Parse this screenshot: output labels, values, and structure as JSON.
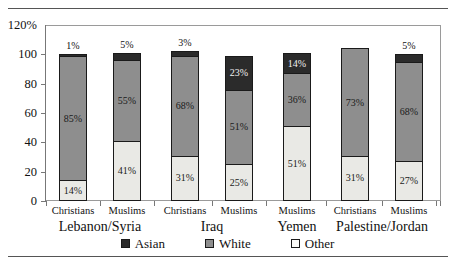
{
  "chart_data": {
    "type": "bar",
    "subtype": "stacked-bar",
    "title": "",
    "xlabel": "",
    "ylabel": "",
    "ylim": [
      0,
      120
    ],
    "y_tick_labels": [
      "120%",
      "100",
      "80",
      "60",
      "40",
      "20",
      "0"
    ],
    "y_tick_values": [
      120,
      100,
      80,
      60,
      40,
      20,
      0
    ],
    "grid": false,
    "legend_position": "bottom",
    "categories": [
      "Christians",
      "Muslims",
      "Christians",
      "Muslims",
      "Muslims",
      "Christians",
      "Muslims"
    ],
    "groups": [
      {
        "name": "Lebanon/Syria",
        "members": [
          0,
          1
        ]
      },
      {
        "name": "Iraq",
        "members": [
          2,
          3
        ]
      },
      {
        "name": "Yemen",
        "members": [
          4
        ]
      },
      {
        "name": "Palestine/Jordan",
        "members": [
          5,
          6
        ]
      }
    ],
    "series": [
      {
        "name": "Other",
        "color": "#e9e9e5",
        "values": [
          14,
          41,
          31,
          25,
          51,
          31,
          27
        ]
      },
      {
        "name": "White",
        "color": "#8e8e8e",
        "values": [
          85,
          55,
          68,
          51,
          36,
          73,
          68
        ]
      },
      {
        "name": "Asian",
        "color": "#2b2b2b",
        "values": [
          1,
          5,
          3,
          23,
          14,
          0,
          5
        ]
      }
    ],
    "legend_entries": [
      {
        "label": "Asian",
        "swatch": "asian"
      },
      {
        "label": "White",
        "swatch": "white"
      },
      {
        "label": "Other",
        "swatch": "other"
      }
    ],
    "bar_top_labels": [
      "1%",
      "5%",
      "3%",
      "",
      "",
      "",
      "5%"
    ],
    "segment_labels": [
      {
        "bar": 0,
        "other": "14%",
        "white": "85%",
        "asian": ""
      },
      {
        "bar": 1,
        "other": "41%",
        "white": "55%",
        "asian": ""
      },
      {
        "bar": 2,
        "other": "31%",
        "white": "68%",
        "asian": ""
      },
      {
        "bar": 3,
        "other": "25%",
        "white": "51%",
        "asian": "23%"
      },
      {
        "bar": 4,
        "other": "51%",
        "white": "36%",
        "asian": "14%"
      },
      {
        "bar": 5,
        "other": "31%",
        "white": "73%",
        "asian": ""
      },
      {
        "bar": 6,
        "other": "27%",
        "white": "68%",
        "asian": ""
      }
    ]
  }
}
